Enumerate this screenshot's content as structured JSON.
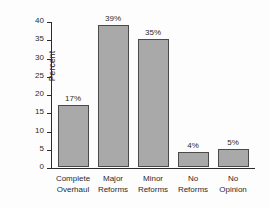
{
  "chart_data": {
    "type": "bar",
    "title": "",
    "xlabel": "",
    "ylabel": "Percent",
    "ylim": [
      0,
      40
    ],
    "ytick_step": 5,
    "yticks": [
      "40",
      "35",
      "30",
      "25",
      "20",
      "15",
      "10",
      "5",
      "0"
    ],
    "grid": false,
    "legend": "none",
    "categories": [
      "Complete Overhaul",
      "Major Reforms",
      "Minor Reforms",
      "No Reforms",
      "No Opinion"
    ],
    "category_lines": [
      [
        "Complete",
        "Overhaul"
      ],
      [
        "Major",
        "Reforms"
      ],
      [
        "Minor",
        "Reforms"
      ],
      [
        "No",
        "Reforms"
      ],
      [
        "No",
        "Opinion"
      ]
    ],
    "values": [
      17,
      39,
      35,
      4,
      5
    ],
    "data_labels": [
      "17%",
      "39%",
      "35%",
      "4%",
      "5%"
    ],
    "bar_fill_color": "#a9a9a9",
    "bar_border_color": "#4a4a4a",
    "axis_color": "#2b2b2b",
    "background_color": "#fdfdfd"
  }
}
